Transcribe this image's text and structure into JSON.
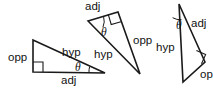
{
  "figure": {
    "background_color": "#ffffff",
    "stroke_color": "#1a1a1a",
    "text_color": "#111111",
    "angle_symbol": "θ"
  },
  "triangles": [
    {
      "id": "triangle-1",
      "orientation": "upright, right angle at lower-left",
      "vertices": {
        "apex": [
          33,
          40
        ],
        "right_angle": [
          33,
          72
        ],
        "theta": [
          105,
          73
        ]
      },
      "labels": {
        "opposite": "opp",
        "adjacent": "adj",
        "hypotenuse": "hyp",
        "angle": "θ"
      }
    },
    {
      "id": "triangle-2",
      "orientation": "rotated, right angle at top-right",
      "vertices": {
        "theta": [
          88,
          21
        ],
        "right_angle": [
          118,
          12
        ],
        "far": [
          140,
          74
        ]
      },
      "labels": {
        "opposite": "opp",
        "adjacent": "adj",
        "hypotenuse": "hyp",
        "angle": "θ"
      }
    },
    {
      "id": "triangle-3",
      "orientation": "rotated, right angle at right, clipped at frame edge",
      "vertices": {
        "theta": [
          179,
          4
        ],
        "right_angle": [
          205,
          62
        ],
        "far": [
          183,
          82
        ]
      },
      "labels": {
        "opposite": "op",
        "adjacent": "adj",
        "hypotenuse": "hyp",
        "angle": "θ"
      }
    }
  ]
}
